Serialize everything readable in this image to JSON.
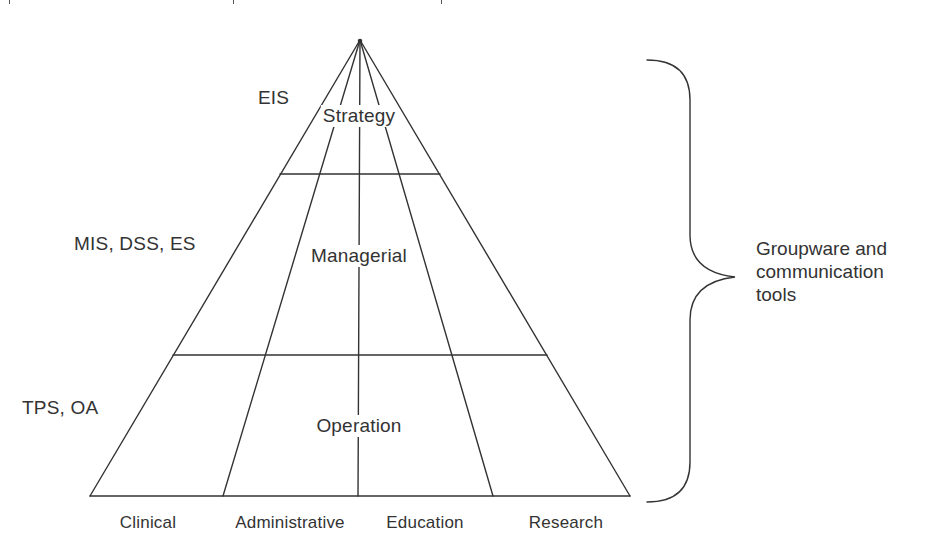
{
  "diagram": {
    "type": "pyramid",
    "levels": [
      {
        "name": "Strategy",
        "systems": "EIS"
      },
      {
        "name": "Managerial",
        "systems": "MIS, DSS, ES"
      },
      {
        "name": "Operation",
        "systems": "TPS, OA"
      }
    ],
    "columns": [
      "Clinical",
      "Administrative",
      "Education",
      "Research"
    ],
    "brace_label": {
      "lines": [
        "Groupware and",
        "communication",
        "tools"
      ]
    },
    "colors": {
      "line": "#333333",
      "text": "#333333",
      "background": "#ffffff"
    }
  }
}
